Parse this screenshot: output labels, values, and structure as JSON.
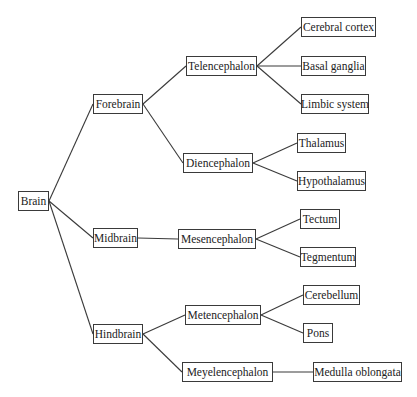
{
  "diagram": {
    "type": "tree",
    "root": "Brain",
    "nodes": [
      {
        "id": "brain",
        "label": "Brain",
        "x": 18,
        "y": 191,
        "w": 31
      },
      {
        "id": "forebrain",
        "label": "Forebrain",
        "x": 93,
        "y": 94,
        "w": 50
      },
      {
        "id": "midbrain",
        "label": "Midbrain",
        "x": 93,
        "y": 228,
        "w": 45
      },
      {
        "id": "hindbrain",
        "label": "Hindbrain",
        "x": 93,
        "y": 324,
        "w": 50
      },
      {
        "id": "telencephalon",
        "label": "Telencephalon",
        "x": 186,
        "y": 56,
        "w": 71
      },
      {
        "id": "diencephalon",
        "label": "Diencephalon",
        "x": 183,
        "y": 153,
        "w": 70
      },
      {
        "id": "mesencephalon",
        "label": "Mesencephalon",
        "x": 178,
        "y": 229,
        "w": 78
      },
      {
        "id": "metencephalon",
        "label": "Metencephalon",
        "x": 185,
        "y": 305,
        "w": 76
      },
      {
        "id": "meyelencephalon",
        "label": "Meyelencephalon",
        "x": 182,
        "y": 362,
        "w": 91
      },
      {
        "id": "cerebral_cortex",
        "label": "Cerebral cortex",
        "x": 301,
        "y": 17,
        "w": 75
      },
      {
        "id": "basal_ganglia",
        "label": "Basal ganglia",
        "x": 301,
        "y": 56,
        "w": 65
      },
      {
        "id": "limbic_system",
        "label": "Limbic system",
        "x": 301,
        "y": 94,
        "w": 68
      },
      {
        "id": "thalamus",
        "label": "Thalamus",
        "x": 297,
        "y": 133,
        "w": 49
      },
      {
        "id": "hypothalamus",
        "label": "Hypothalamus",
        "x": 297,
        "y": 171,
        "w": 69
      },
      {
        "id": "tectum",
        "label": "Tectum",
        "x": 300,
        "y": 209,
        "w": 40
      },
      {
        "id": "tegmentum",
        "label": "Tegmentum",
        "x": 300,
        "y": 247,
        "w": 56
      },
      {
        "id": "cerebellum",
        "label": "Cerebellum",
        "x": 303,
        "y": 285,
        "w": 57
      },
      {
        "id": "pons",
        "label": "Pons",
        "x": 303,
        "y": 323,
        "w": 30
      },
      {
        "id": "medulla_oblongata",
        "label": "Medulla oblongata",
        "x": 313,
        "y": 362,
        "w": 89
      }
    ],
    "edges": [
      [
        "brain",
        "forebrain"
      ],
      [
        "brain",
        "midbrain"
      ],
      [
        "brain",
        "hindbrain"
      ],
      [
        "forebrain",
        "telencephalon"
      ],
      [
        "forebrain",
        "diencephalon"
      ],
      [
        "midbrain",
        "mesencephalon"
      ],
      [
        "hindbrain",
        "metencephalon"
      ],
      [
        "hindbrain",
        "meyelencephalon"
      ],
      [
        "telencephalon",
        "cerebral_cortex"
      ],
      [
        "telencephalon",
        "basal_ganglia"
      ],
      [
        "telencephalon",
        "limbic_system"
      ],
      [
        "diencephalon",
        "thalamus"
      ],
      [
        "diencephalon",
        "hypothalamus"
      ],
      [
        "mesencephalon",
        "tectum"
      ],
      [
        "mesencephalon",
        "tegmentum"
      ],
      [
        "metencephalon",
        "cerebellum"
      ],
      [
        "metencephalon",
        "pons"
      ],
      [
        "meyelencephalon",
        "medulla_oblongata"
      ]
    ]
  }
}
